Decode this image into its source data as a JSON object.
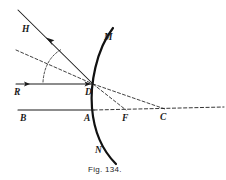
{
  "figure": {
    "caption": "Fig. 134.",
    "background_color": "#ffffff",
    "ink_color": "#1a1a1a"
  },
  "labels": {
    "H": "H",
    "M": "M",
    "R": "R",
    "D": "D",
    "B": "B",
    "A": "A",
    "F": "F",
    "C": "C",
    "N": "N"
  },
  "points": {
    "H": {
      "x": 22,
      "y": 32,
      "label": "H"
    },
    "M": {
      "x": 104,
      "y": 40,
      "label": "M"
    },
    "R": {
      "x": 20,
      "y": 92,
      "label": "R"
    },
    "D": {
      "x": 93,
      "y": 91,
      "label": "D"
    },
    "B": {
      "x": 24,
      "y": 117,
      "label": "B"
    },
    "A": {
      "x": 88,
      "y": 117,
      "label": "A"
    },
    "F": {
      "x": 125,
      "y": 117,
      "label": "F"
    },
    "C": {
      "x": 163,
      "y": 117,
      "label": "C"
    },
    "N": {
      "x": 98,
      "y": 150,
      "label": "N"
    }
  },
  "elements": {
    "mirror_arc": {
      "name": "concave-mirror-arc",
      "endpoint_top_label": "M",
      "endpoint_bottom_label": "N",
      "vertex_label": "A",
      "style": "solid-thick"
    },
    "incident_ray": {
      "name": "incident-ray-RD",
      "from": "R",
      "to": "D",
      "style": "solid",
      "arrows": 2
    },
    "reflected_ray": {
      "name": "reflected-ray-DH",
      "from": "D",
      "to": "H",
      "style": "solid",
      "arrows": 1
    },
    "normal_line": {
      "name": "normal-DC",
      "from": "D",
      "to": "C",
      "style": "dashed"
    },
    "focal_line": {
      "name": "chord-DF",
      "from": "D",
      "to": "F",
      "style": "dashed"
    },
    "construction_line": {
      "name": "construction-line-upper-left",
      "style": "dashed"
    },
    "principal_axis_solid": {
      "name": "principal-axis-BA",
      "from": "B",
      "to": "A",
      "style": "solid"
    },
    "principal_axis_dashed": {
      "name": "principal-axis-AFC-extended",
      "from": "A",
      "through": [
        "F",
        "C"
      ],
      "style": "dashed"
    },
    "angle_marker": {
      "name": "angle-of-incidence-arc",
      "style": "dashed-arc"
    }
  }
}
